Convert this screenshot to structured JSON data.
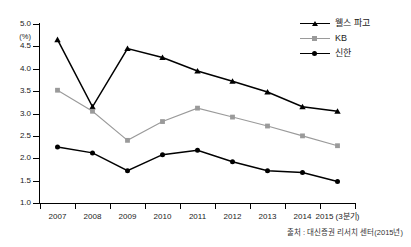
{
  "top_clipped_caption": "",
  "chart_data": {
    "type": "line",
    "title": "",
    "xlabel": "",
    "ylabel": "(%)",
    "unit_label": "(%)",
    "categories": [
      "2007",
      "2008",
      "2009",
      "2010",
      "2011",
      "2012",
      "2013",
      "2014",
      "2015 (3분기)"
    ],
    "ylim": [
      1.0,
      5.0
    ],
    "ytick_values": [
      5.0,
      4.5,
      4.0,
      3.5,
      3.0,
      2.5,
      2.0,
      1.5,
      1.0
    ],
    "ytick_labels": [
      "5.0",
      "4.5",
      "4.0",
      "3.5",
      "3.0",
      "2.5",
      "2.0",
      "1.5",
      "1.0"
    ],
    "grid": false,
    "legend_position": "top-right",
    "series": [
      {
        "name": "웰스 파고",
        "marker": "triangle",
        "color": "#000000",
        "values": [
          4.65,
          3.15,
          4.45,
          4.25,
          3.95,
          3.72,
          3.48,
          3.15,
          3.05
        ]
      },
      {
        "name": "KB",
        "marker": "square",
        "color": "#9a9a9a",
        "values": [
          3.52,
          3.05,
          2.4,
          2.82,
          3.12,
          2.92,
          2.72,
          2.5,
          2.28
        ]
      },
      {
        "name": "신한",
        "marker": "circle",
        "color": "#000000",
        "values": [
          2.25,
          2.12,
          1.72,
          2.08,
          2.18,
          1.92,
          1.72,
          1.68,
          1.48
        ]
      }
    ]
  },
  "source_note": "출처 : 대신증권 리서치 센터(2015년)"
}
